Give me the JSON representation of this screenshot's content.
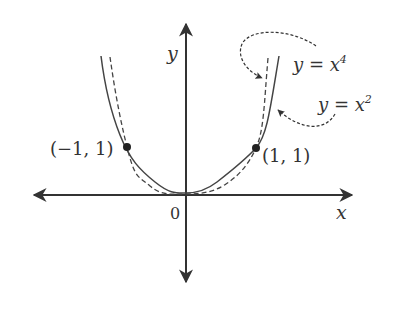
{
  "figure": {
    "axes": {
      "x_label": "x",
      "y_label": "y",
      "origin_label": "0"
    },
    "points": [
      {
        "label": "(−1, 1)",
        "x": -1,
        "y": 1
      },
      {
        "label": "(1, 1)",
        "x": 1,
        "y": 1
      }
    ],
    "curves": [
      {
        "name": "y = x^2",
        "style": "solid",
        "label_base": "y = x",
        "label_exp": "2"
      },
      {
        "name": "y = x^4",
        "style": "dashed",
        "label_base": "y = x",
        "label_exp": "4"
      }
    ],
    "colors": {
      "stroke": "#333333",
      "background": "#ffffff"
    }
  }
}
